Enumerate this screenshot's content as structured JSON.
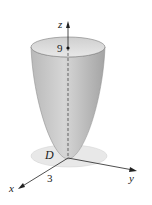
{
  "figure": {
    "axes": {
      "x_label": "x",
      "y_label": "y",
      "z_label": "z"
    },
    "annotations": {
      "height_label": "9",
      "radius_label": "3",
      "region_label": "D"
    },
    "colors": {
      "surface_light": "#e4e4e4",
      "surface_dark": "#a8a8a8",
      "disk": "#e6e6e6",
      "axis": "#222222"
    }
  }
}
